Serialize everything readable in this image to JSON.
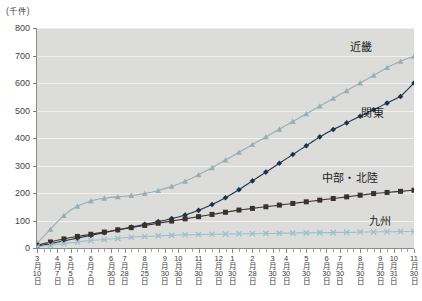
{
  "chart_data": {
    "type": "line",
    "title": "",
    "unit_label": "(千件)",
    "ylabel": "",
    "xlabel": "",
    "ylim": [
      0,
      800
    ],
    "yticks": [
      0,
      100,
      200,
      300,
      400,
      500,
      600,
      700,
      800
    ],
    "grid": true,
    "legend_position": "inline-right",
    "x_tick_labels": [
      {
        "month": "3",
        "day": "10"
      },
      {
        "month": "4",
        "day": "7"
      },
      {
        "month": "5",
        "day": "5"
      },
      {
        "month": "6",
        "day": "2"
      },
      {
        "month": "6",
        "day": "30"
      },
      {
        "month": "7",
        "day": "28"
      },
      {
        "month": "8",
        "day": "25"
      },
      {
        "month": "9",
        "day": "30"
      },
      {
        "month": "10",
        "day": "30"
      },
      {
        "month": "11",
        "day": "30"
      },
      {
        "month": "12",
        "day": "30"
      },
      {
        "month": "1",
        "day": "30"
      },
      {
        "month": "2",
        "day": "28"
      },
      {
        "month": "3",
        "day": "30"
      },
      {
        "month": "4",
        "day": "30"
      },
      {
        "month": "5",
        "day": "30"
      },
      {
        "month": "6",
        "day": "30"
      },
      {
        "month": "7",
        "day": "30"
      },
      {
        "month": "8",
        "day": "30"
      },
      {
        "month": "9",
        "day": "30"
      },
      {
        "month": "10",
        "day": "31"
      },
      {
        "month": "11",
        "day": "30"
      }
    ],
    "month_suffix": "月",
    "day_suffix": "日",
    "series": [
      {
        "name": "近畿",
        "color": "#9aacb4",
        "marker": "triangle",
        "values": [
          18,
          42,
          68,
          95,
          118,
          138,
          152,
          163,
          171,
          177,
          181,
          184,
          186,
          188,
          191,
          194,
          198,
          203,
          209,
          216,
          224,
          233,
          243,
          254,
          266,
          279,
          292,
          306,
          320,
          334,
          348,
          362,
          376,
          390,
          404,
          418,
          432,
          446,
          460,
          474,
          488,
          502,
          516,
          530,
          544,
          558,
          572,
          586,
          600,
          614,
          628,
          642,
          656,
          668,
          679,
          689,
          697
        ]
      },
      {
        "name": "関東",
        "color": "#1d3448",
        "marker": "diamond",
        "values": [
          6,
          11,
          16,
          21,
          26,
          31,
          36,
          41,
          46,
          51,
          56,
          61,
          66,
          71,
          76,
          81,
          86,
          91,
          96,
          101,
          107,
          113,
          120,
          128,
          137,
          147,
          158,
          170,
          183,
          197,
          212,
          228,
          244,
          260,
          276,
          292,
          308,
          324,
          340,
          356,
          372,
          388,
          404,
          418,
          431,
          443,
          455,
          467,
          479,
          491,
          503,
          515,
          527,
          539,
          551,
          575,
          600
        ]
      },
      {
        "name": "中部・北陸",
        "color": "#3a312c",
        "marker": "square",
        "values": [
          10,
          16,
          22,
          28,
          33,
          38,
          42,
          46,
          50,
          54,
          58,
          62,
          66,
          70,
          74,
          78,
          82,
          86,
          90,
          94,
          98,
          102,
          106,
          110,
          114,
          118,
          122,
          126,
          130,
          134,
          138,
          141,
          144,
          147,
          150,
          153,
          156,
          159,
          162,
          165,
          168,
          171,
          174,
          177,
          180,
          183,
          186,
          189,
          192,
          195,
          198,
          200,
          202,
          204,
          206,
          208,
          210
        ]
      },
      {
        "name": "九州",
        "color": "#9cc0c8",
        "marker": "x",
        "values": [
          4,
          7,
          10,
          13,
          16,
          19,
          22,
          25,
          27,
          29,
          31,
          33,
          35,
          37,
          39,
          41,
          42,
          43,
          44,
          45,
          46,
          47,
          48,
          48,
          49,
          49,
          50,
          50,
          51,
          51,
          52,
          52,
          52,
          53,
          53,
          53,
          54,
          54,
          54,
          55,
          55,
          55,
          56,
          56,
          56,
          57,
          57,
          57,
          58,
          58,
          58,
          59,
          59,
          59,
          60,
          60,
          60
        ]
      }
    ],
    "annotations": [
      {
        "name": "近畿",
        "x_pct": 86,
        "y_px": 38
      },
      {
        "name": "関東",
        "x_pct": 89,
        "y_px": 104
      },
      {
        "name": "中部・北陸",
        "x_pct": 83,
        "y_px": 169
      },
      {
        "name": "九州",
        "x_pct": 91,
        "y_px": 212
      }
    ]
  }
}
